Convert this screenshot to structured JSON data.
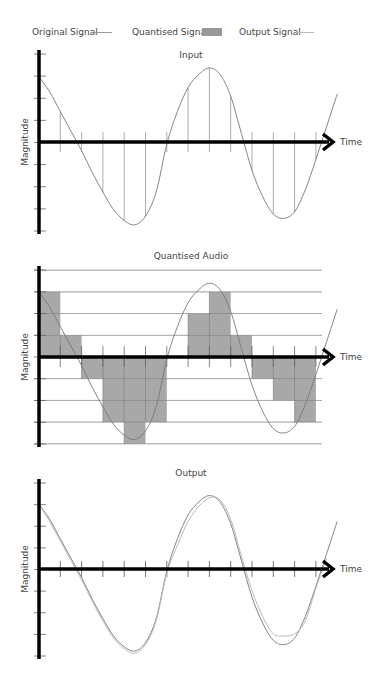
{
  "legend": {
    "original": "Original Signal",
    "quantised": "Quantised Signal",
    "output": "Output Signal"
  },
  "colors": {
    "axis": "#000000",
    "signal": "#777777",
    "output_signal": "#bbbbbb",
    "bars": "#999999",
    "grid": "#bbbbbb",
    "sample_lines": "#999999"
  },
  "chart_data": [
    {
      "type": "line",
      "title": "Input",
      "xlabel": "Time",
      "ylabel": "Magnitude",
      "ylim": [
        -4,
        4
      ],
      "xlim": [
        0,
        14
      ],
      "y_ticks": 9,
      "sample_times": [
        1,
        2,
        3,
        4,
        5,
        6,
        7,
        8,
        9,
        10,
        11,
        12,
        13
      ],
      "series": [
        {
          "name": "Original Signal",
          "x": [
            0,
            0.5,
            1,
            1.5,
            2,
            2.5,
            3,
            3.5,
            4,
            4.5,
            5,
            5.5,
            6,
            6.5,
            7,
            7.5,
            8,
            8.5,
            9,
            9.5,
            10,
            10.5,
            11,
            11.5,
            12,
            12.5,
            13,
            13.5,
            14
          ],
          "y": [
            3.0,
            2.3,
            1.4,
            0.5,
            -0.4,
            -1.4,
            -2.3,
            -3.1,
            -3.6,
            -3.8,
            -3.4,
            -2.3,
            -0.1,
            1.4,
            2.5,
            3.1,
            3.4,
            3.1,
            2.1,
            0.4,
            -1.3,
            -2.5,
            -3.3,
            -3.5,
            -3.2,
            -2.2,
            -0.8,
            0.7,
            2.2
          ]
        }
      ]
    },
    {
      "type": "bar",
      "title": "Quantised Audio",
      "xlabel": "Time",
      "ylabel": "Magnitude",
      "ylim": [
        -4,
        4
      ],
      "xlim": [
        0,
        14
      ],
      "grid": true,
      "categories": [
        "0-1",
        "1-2",
        "2-3",
        "3-4",
        "4-5",
        "5-6",
        "6-7",
        "7-8",
        "8-9",
        "9-10",
        "10-11",
        "11-12",
        "12-13"
      ],
      "values": [
        3,
        1,
        -1,
        -3,
        -4,
        -3,
        0,
        2,
        3,
        1,
        -1,
        -2,
        -3
      ],
      "series": [
        {
          "name": "Original Signal",
          "ref": "chart_data.0.series.0"
        }
      ]
    },
    {
      "type": "line",
      "title": "Output",
      "xlabel": "Time",
      "ylabel": "Magnitude",
      "ylim": [
        -4,
        4
      ],
      "xlim": [
        0,
        14
      ],
      "x_ticks": [
        1,
        2,
        3,
        4,
        5,
        6,
        7,
        8,
        9,
        10,
        11,
        12,
        13
      ],
      "series": [
        {
          "name": "Original Signal",
          "ref": "chart_data.0.series.0"
        },
        {
          "name": "Output Signal",
          "x": [
            0,
            0.5,
            1,
            1.5,
            2,
            2.5,
            3,
            3.5,
            4,
            4.5,
            5,
            5.5,
            6,
            6.5,
            7,
            7.5,
            8,
            8.5,
            9,
            9.5,
            10,
            10.5,
            11,
            11.5,
            12,
            12.5,
            13,
            13.5
          ],
          "y": [
            3.0,
            2.2,
            1.3,
            0.4,
            -0.5,
            -1.5,
            -2.4,
            -3.2,
            -3.7,
            -3.9,
            -3.5,
            -2.4,
            -0.2,
            1.1,
            2.2,
            2.9,
            3.3,
            3.2,
            2.3,
            0.6,
            -1.0,
            -2.2,
            -3.0,
            -3.1,
            -3.0,
            -2.4,
            -0.9,
            0.5
          ]
        }
      ]
    }
  ]
}
